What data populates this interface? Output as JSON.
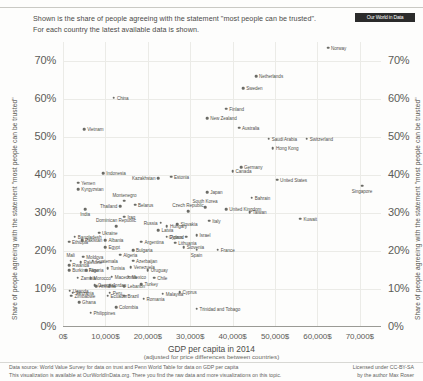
{
  "header": {
    "subtitle_line1": "Shown is the share of people agreeing with the statement \"most people can be trusted\".",
    "subtitle_line2": "For each country the latest available data is shown.",
    "logo_text": "Our World in Data"
  },
  "footer": {
    "left_line1": "Data source: World Value Survey for data on trust and Penn World Table for data on GDP per capita",
    "left_line2": "This visualization is available at OurWorldInData.org. There you find the raw data and more visualizations on this topic.",
    "right_line1": "Licensed under CC-BY-SA",
    "right_line2": "by the author Max Roser"
  },
  "chart_data": {
    "type": "scatter",
    "title": "Shown is the share of people agreeing with the statement \"most people can be trusted\".",
    "xlabel": "GDP per capita in 2014",
    "xlabel_sub": "(adjusted for price differences between countries)",
    "ylabel": "Share of people agreeing with the statement \"most people can be trusted\"",
    "ylabel_right": "Share of people agreeing with the statement \"most people can be trusted\"",
    "xlim": [
      0,
      75000
    ],
    "ylim": [
      0,
      75
    ],
    "grid": true,
    "xticks": [
      0,
      10000,
      20000,
      30000,
      40000,
      50000,
      60000,
      70000
    ],
    "xticklabels": [
      "0$",
      "10,000$",
      "20,000$",
      "30,000$",
      "40,000$",
      "50,000$",
      "60,000$",
      "70,000$"
    ],
    "yticks": [
      0,
      10,
      20,
      30,
      40,
      50,
      60,
      70
    ],
    "yticklabels": [
      "0%",
      "10%",
      "20%",
      "30%",
      "40%",
      "50%",
      "60%",
      "70%"
    ],
    "point_color": "#6b6b66",
    "points": [
      {
        "name": "Norway",
        "x": 62500,
        "y": 73.5,
        "pos": "r"
      },
      {
        "name": "Netherlands",
        "x": 45500,
        "y": 66.0,
        "pos": "r"
      },
      {
        "name": "Sweden",
        "x": 42500,
        "y": 62.8,
        "pos": "r"
      },
      {
        "name": "China",
        "x": 12000,
        "y": 60.3,
        "pos": "r"
      },
      {
        "name": "Finland",
        "x": 38500,
        "y": 57.5,
        "pos": "r"
      },
      {
        "name": "New Zealand",
        "x": 34000,
        "y": 55.0,
        "pos": "r"
      },
      {
        "name": "Australia",
        "x": 41500,
        "y": 52.5,
        "pos": "r"
      },
      {
        "name": "Vietnam",
        "x": 5000,
        "y": 52.0,
        "pos": "r"
      },
      {
        "name": "Saudi Arabia",
        "x": 48500,
        "y": 49.5,
        "pos": "r"
      },
      {
        "name": "Switzerland",
        "x": 57500,
        "y": 49.5,
        "pos": "r"
      },
      {
        "name": "Hong Kong",
        "x": 49500,
        "y": 47.0,
        "pos": "r"
      },
      {
        "name": "Germany",
        "x": 42000,
        "y": 42.0,
        "pos": "r"
      },
      {
        "name": "Canada",
        "x": 40000,
        "y": 41.0,
        "pos": "r"
      },
      {
        "name": "Indonesia",
        "x": 9500,
        "y": 40.5,
        "pos": "r"
      },
      {
        "name": "Estonia",
        "x": 25500,
        "y": 39.5,
        "pos": "r"
      },
      {
        "name": "United States",
        "x": 50500,
        "y": 38.8,
        "pos": "r"
      },
      {
        "name": "Kazakhstan",
        "x": 22500,
        "y": 39.2,
        "pos": "l"
      },
      {
        "name": "Yemen",
        "x": 3600,
        "y": 38.0,
        "pos": "r"
      },
      {
        "name": "Kyrgyzstan",
        "x": 3600,
        "y": 36.3,
        "pos": "r"
      },
      {
        "name": "Singapore",
        "x": 70500,
        "y": 37.2,
        "pos": "b"
      },
      {
        "name": "Japan",
        "x": 34000,
        "y": 35.5,
        "pos": "r"
      },
      {
        "name": "Bahrain",
        "x": 44500,
        "y": 34.0,
        "pos": "r"
      },
      {
        "name": "Montenegro",
        "x": 14500,
        "y": 33.2,
        "pos": "t"
      },
      {
        "name": "Belarus",
        "x": 17000,
        "y": 32.2,
        "pos": "r"
      },
      {
        "name": "Thailand",
        "x": 13500,
        "y": 31.8,
        "pos": "l"
      },
      {
        "name": "India",
        "x": 5200,
        "y": 31.0,
        "pos": "b"
      },
      {
        "name": "United Kingdom",
        "x": 38500,
        "y": 31.0,
        "pos": "r"
      },
      {
        "name": "South Korea",
        "x": 33500,
        "y": 31.5,
        "pos": "t"
      },
      {
        "name": "Czech Republic",
        "x": 29500,
        "y": 30.5,
        "pos": "t"
      },
      {
        "name": "Taiwan",
        "x": 44000,
        "y": 30.2,
        "pos": "r"
      },
      {
        "name": "Iraq",
        "x": 14500,
        "y": 29.0,
        "pos": "r"
      },
      {
        "name": "Kuwait",
        "x": 56000,
        "y": 28.5,
        "pos": "r"
      },
      {
        "name": "Italy",
        "x": 34500,
        "y": 28.0,
        "pos": "r"
      },
      {
        "name": "Slovakia",
        "x": 27000,
        "y": 27.0,
        "pos": "r"
      },
      {
        "name": "Russia",
        "x": 23000,
        "y": 27.5,
        "pos": "l"
      },
      {
        "name": "Hungary",
        "x": 24500,
        "y": 26.5,
        "pos": "r"
      },
      {
        "name": "Dominican Republic",
        "x": 12500,
        "y": 26.5,
        "pos": "t"
      },
      {
        "name": "Latvia",
        "x": 22500,
        "y": 25.5,
        "pos": "r"
      },
      {
        "name": "Ukraine",
        "x": 8500,
        "y": 24.8,
        "pos": "r"
      },
      {
        "name": "Bangladesh",
        "x": 2800,
        "y": 23.8,
        "pos": "r"
      },
      {
        "name": "Poland",
        "x": 24500,
        "y": 23.8,
        "pos": "r"
      },
      {
        "name": "Israel",
        "x": 31500,
        "y": 24.2,
        "pos": "r"
      },
      {
        "name": "Cyprus",
        "x": 29000,
        "y": 23.8,
        "pos": "l"
      },
      {
        "name": "Pakistan",
        "x": 4500,
        "y": 22.8,
        "pos": "r"
      },
      {
        "name": "Ethiopia",
        "x": 1400,
        "y": 22.5,
        "pos": "r"
      },
      {
        "name": "Albania",
        "x": 10000,
        "y": 22.8,
        "pos": "r"
      },
      {
        "name": "Argentina",
        "x": 18500,
        "y": 22.5,
        "pos": "r"
      },
      {
        "name": "Lithuania",
        "x": 26500,
        "y": 22.2,
        "pos": "r"
      },
      {
        "name": "Slovenia",
        "x": 28500,
        "y": 21.0,
        "pos": "r"
      },
      {
        "name": "Spain",
        "x": 31500,
        "y": 20.3,
        "pos": "b"
      },
      {
        "name": "France",
        "x": 36500,
        "y": 20.3,
        "pos": "r"
      },
      {
        "name": "Egypt",
        "x": 10000,
        "y": 21.0,
        "pos": "r"
      },
      {
        "name": "Bulgaria",
        "x": 16500,
        "y": 20.2,
        "pos": "r"
      },
      {
        "name": "Algeria",
        "x": 13500,
        "y": 19.0,
        "pos": "r"
      },
      {
        "name": "Moldova",
        "x": 4800,
        "y": 18.5,
        "pos": "r"
      },
      {
        "name": "Mali",
        "x": 1800,
        "y": 17.5,
        "pos": "t"
      },
      {
        "name": "Palestine",
        "x": 4200,
        "y": 17.0,
        "pos": "r"
      },
      {
        "name": "Guatemala",
        "x": 7000,
        "y": 17.5,
        "pos": "r"
      },
      {
        "name": "Azerbaijan",
        "x": 16500,
        "y": 17.5,
        "pos": "r"
      },
      {
        "name": "Rwanda",
        "x": 1500,
        "y": 16.2,
        "pos": "r"
      },
      {
        "name": "Burkina Faso",
        "x": 1500,
        "y": 15.0,
        "pos": "r"
      },
      {
        "name": "Nigeria",
        "x": 5500,
        "y": 15.0,
        "pos": "r"
      },
      {
        "name": "Tunisia",
        "x": 10500,
        "y": 15.5,
        "pos": "r"
      },
      {
        "name": "Venezuela",
        "x": 16000,
        "y": 15.8,
        "pos": "r"
      },
      {
        "name": "Uruguay",
        "x": 20000,
        "y": 15.0,
        "pos": "r"
      },
      {
        "name": "Zambia",
        "x": 3500,
        "y": 13.0,
        "pos": "r"
      },
      {
        "name": "Morocco",
        "x": 6500,
        "y": 12.8,
        "pos": "r"
      },
      {
        "name": "Macedonia",
        "x": 11500,
        "y": 13.2,
        "pos": "r"
      },
      {
        "name": "Mexico",
        "x": 15500,
        "y": 13.2,
        "pos": "r"
      },
      {
        "name": "Chile",
        "x": 21500,
        "y": 13.0,
        "pos": "r"
      },
      {
        "name": "Turkey",
        "x": 18500,
        "y": 11.2,
        "pos": "r"
      },
      {
        "name": "Georgia",
        "x": 7500,
        "y": 11.0,
        "pos": "r"
      },
      {
        "name": "Armenia",
        "x": 7800,
        "y": 10.8,
        "pos": "r"
      },
      {
        "name": "Jordan",
        "x": 11000,
        "y": 11.0,
        "pos": "r"
      },
      {
        "name": "Lebanon",
        "x": 14500,
        "y": 10.8,
        "pos": "r"
      },
      {
        "name": "Uganda",
        "x": 1600,
        "y": 9.5,
        "pos": "r"
      },
      {
        "name": "Tanzania",
        "x": 2300,
        "y": 9.0,
        "pos": "r"
      },
      {
        "name": "Zimbabwe",
        "x": 2000,
        "y": 8.2,
        "pos": "r"
      },
      {
        "name": "Peru",
        "x": 11000,
        "y": 9.0,
        "pos": "r"
      },
      {
        "name": "Ecuador",
        "x": 10500,
        "y": 8.2,
        "pos": "r"
      },
      {
        "name": "Brazil",
        "x": 14500,
        "y": 8.2,
        "pos": "r"
      },
      {
        "name": "Malaysia",
        "x": 23500,
        "y": 8.8,
        "pos": "r"
      },
      {
        "name": "Cyprus2",
        "x": 27500,
        "y": 9.2,
        "pos": "r"
      },
      {
        "name": "Romania",
        "x": 19000,
        "y": 7.5,
        "pos": "r"
      },
      {
        "name": "Ghana",
        "x": 3800,
        "y": 6.5,
        "pos": "r"
      },
      {
        "name": "Colombia",
        "x": 12500,
        "y": 5.2,
        "pos": "r"
      },
      {
        "name": "Philippines",
        "x": 6500,
        "y": 3.8,
        "pos": "r"
      },
      {
        "name": "Trinidad and Tobago",
        "x": 31500,
        "y": 4.8,
        "pos": "r"
      }
    ]
  }
}
